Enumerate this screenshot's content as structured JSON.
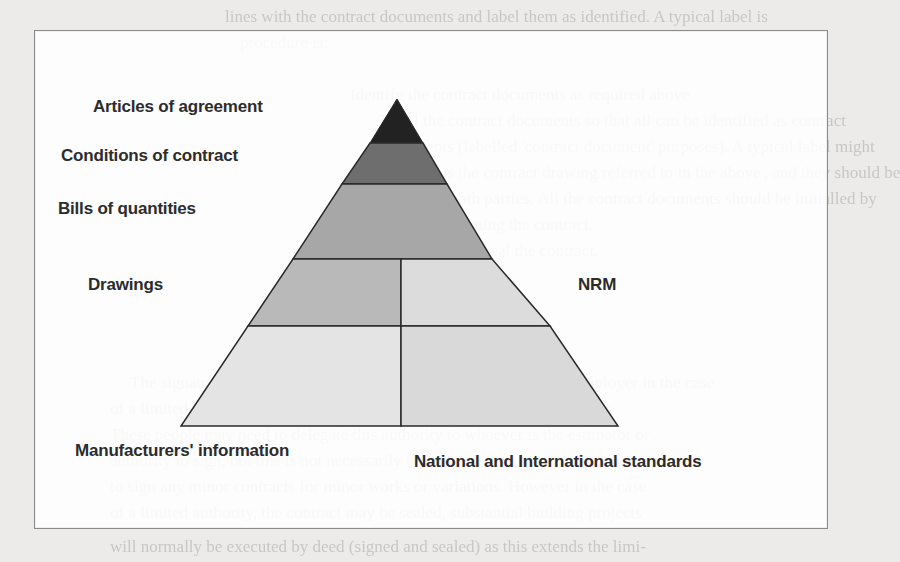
{
  "diagram": {
    "type": "pyramid",
    "title": "",
    "layers": [
      {
        "id": "articles",
        "label": "Articles of agreement",
        "color": "#222222"
      },
      {
        "id": "conditions",
        "label": "Conditions of contract",
        "color": "#6e6e6e"
      },
      {
        "id": "bills",
        "label": "Bills of quantities",
        "color": "#a7a7a7"
      },
      {
        "id": "drawings",
        "label": "Drawings",
        "color": "#b9b9b9"
      },
      {
        "id": "nrm",
        "label": "NRM",
        "color": "#dcdcdc"
      },
      {
        "id": "manufacturers",
        "label": "Manufacturers' information",
        "color": "#e3e3e3"
      },
      {
        "id": "standards",
        "label": "National and International standards",
        "color": "#dadada"
      }
    ],
    "labels": {
      "articles": "Articles of agreement",
      "conditions": "Conditions of contract",
      "bills": "Bills of quantities",
      "drawings": "Drawings",
      "nrm": "NRM",
      "manufacturers": "Manufacturers' information",
      "standards": "National and International standards"
    },
    "colors": {
      "outline": "#3a3a3a",
      "frame_border": "#8a8a8a",
      "page_bg": "#ecebea"
    }
  },
  "background_text": {
    "lines": [
      "lines with the contract documents and label them as identified. A typical label is",
      "procedure is:",
      "Identify the contract documents as required above.",
      "Label the contract documents so that all can be identified as contract",
      "documents (labelled 'contract document' purposes). A typical label might",
      "be: 'This is the contract drawing referred to in the above', and they should be",
      "signed by both parties. All the contract documents should be initialled by",
      "the parties signing the contract.",
      "Sign, witness and seal the contract.",
      "The signatory should have the necessary authority to commit the employer in the case",
      "of a limited company, public authority or, in the case of a public authority,",
      "These people may need to delegate this authority to whoever is the estimator or",
      "authority to sign, but this is not necessarily the case, in particular, in relation",
      "to sign any minor contracts for minor works or variations. However in the case",
      "of a limited authority, the contract may be sealed, substantial building projects",
      "will normally be executed by deed (signed and sealed) as this extends the limi-"
    ]
  }
}
